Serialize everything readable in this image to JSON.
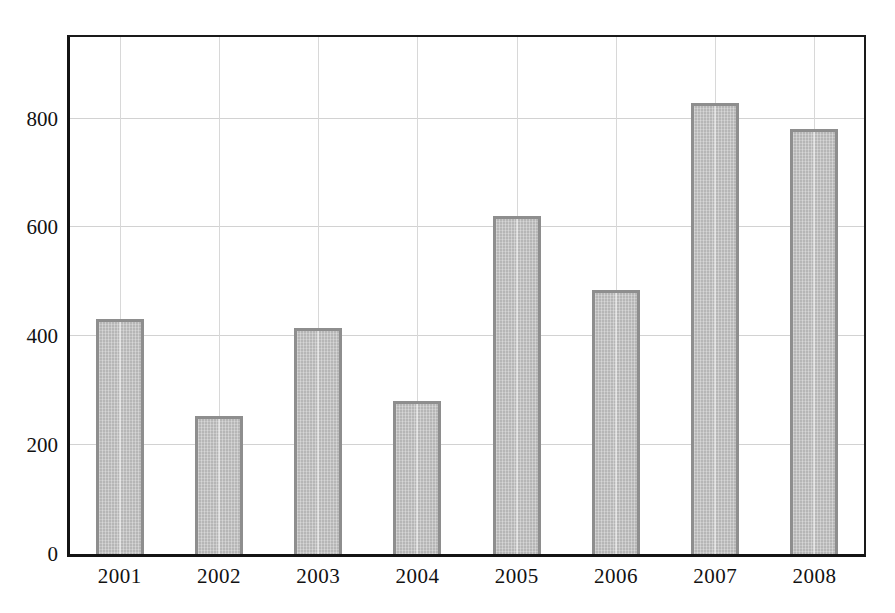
{
  "chart_data": {
    "type": "bar",
    "title": "",
    "subtitle": "",
    "xlabel": "",
    "ylabel": "",
    "categories": [
      "2001",
      "2002",
      "2003",
      "2004",
      "2005",
      "2006",
      "2007",
      "2008"
    ],
    "values": [
      431,
      253,
      416,
      281,
      622,
      485,
      829,
      781
    ],
    "ylim": [
      0,
      950
    ],
    "ytick_labels": [
      "0",
      "200",
      "400",
      "600",
      "800"
    ],
    "ytick_values": [
      0,
      200,
      400,
      600,
      800
    ],
    "grid": true,
    "grid_horizontal": true,
    "grid_vertical": true,
    "legend": null,
    "legend_position": "none",
    "annotations": [],
    "series": [
      {
        "name": "",
        "values": [
          431,
          253,
          416,
          281,
          622,
          485,
          829,
          781
        ]
      }
    ]
  },
  "style": {
    "bar_fill": "#b6b6b6",
    "bar_border": "#8e8e8e",
    "axis_color": "#141414",
    "grid_color": "#d2d2d2",
    "background": "#ffffff",
    "text_color": "#121212"
  }
}
